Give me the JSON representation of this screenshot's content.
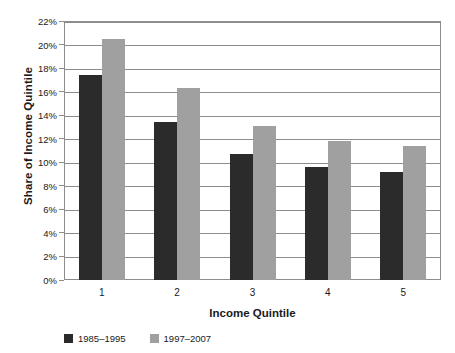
{
  "chart_data": {
    "type": "bar",
    "title": "",
    "xlabel": "Income Quintile",
    "ylabel": "Share of Income Quintile",
    "categories": [
      "1",
      "2",
      "3",
      "4",
      "5"
    ],
    "series": [
      {
        "name": "1985–1995",
        "color": "#2b2b2b",
        "values": [
          17.4,
          13.4,
          10.7,
          9.6,
          9.2
        ]
      },
      {
        "name": "1997–2007",
        "color": "#a0a0a0",
        "values": [
          20.5,
          16.3,
          13.1,
          11.8,
          11.4
        ]
      }
    ],
    "ylim": [
      0,
      22
    ],
    "ytick_step": 2,
    "ytick_labels": [
      "0%",
      "2%",
      "4%",
      "6%",
      "8%",
      "10%",
      "12%",
      "14%",
      "16%",
      "18%",
      "20%",
      "22%"
    ],
    "grid": true,
    "legend_position": "bottom-left",
    "value_suffix": "%"
  }
}
